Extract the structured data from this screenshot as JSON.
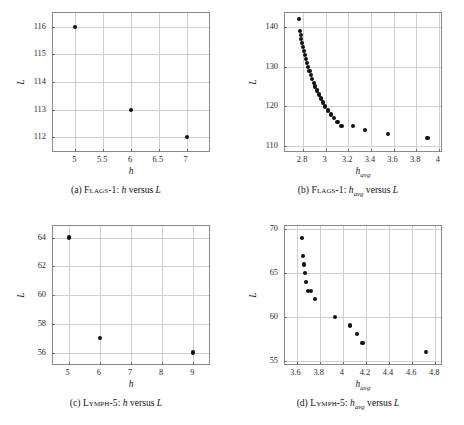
{
  "figure": {
    "panels": [
      {
        "id": "a",
        "caption_index": "(a)",
        "caption_dataset": "Flags-1",
        "caption_rest": ": h versus L",
        "caption_full": "(a) Flags-1: h versus L"
      },
      {
        "id": "b",
        "caption_index": "(b)",
        "caption_dataset": "Flags-1",
        "caption_rest": ": havg versus L",
        "caption_full": "(b) Flags-1: h_avg versus L"
      },
      {
        "id": "c",
        "caption_index": "(c)",
        "caption_dataset": "Lymph-5",
        "caption_rest": ": h versus L",
        "caption_full": "(c) Lymph-5: h versus L"
      },
      {
        "id": "d",
        "caption_index": "(d)",
        "caption_dataset": "Lymph-5",
        "caption_rest": ": havg versus L",
        "caption_full": "(d) Lymph-5: h_avg versus L"
      }
    ]
  },
  "chart_data": [
    {
      "type": "scatter",
      "panel": "a",
      "title": "(a) Flags-1: h versus L",
      "xlabel": "h",
      "ylabel": "L",
      "xlim": [
        4.6,
        7.4
      ],
      "ylim": [
        111.5,
        116.5
      ],
      "xticks": [
        5,
        5.5,
        6,
        6.5,
        7
      ],
      "xticklabels": [
        "5",
        "5.5",
        "6",
        "6.5",
        "7"
      ],
      "yticks": [
        112,
        113,
        114,
        115,
        116
      ],
      "yticklabels": [
        "112",
        "113",
        "114",
        "115",
        "116"
      ],
      "grid": true,
      "legend": null,
      "marker": "filled-circle",
      "marker_color": "#111111",
      "x": [
        5,
        6,
        7
      ],
      "y": [
        116,
        113,
        112
      ],
      "points": [
        {
          "x": 5,
          "y": 116
        },
        {
          "x": 6,
          "y": 113
        },
        {
          "x": 7,
          "y": 112
        }
      ]
    },
    {
      "type": "scatter",
      "panel": "b",
      "title": "(b) Flags-1: h_avg versus L",
      "xlabel": "h_avg",
      "ylabel": "L",
      "xlim": [
        2.64,
        4.02
      ],
      "ylim": [
        108.8,
        143.5
      ],
      "xticks": [
        2.8,
        3.0,
        3.2,
        3.4,
        3.6,
        3.8,
        4.0
      ],
      "xticklabels": [
        "2.8",
        "3",
        "3.2",
        "3.4",
        "3.6",
        "3.8",
        "4"
      ],
      "yticks": [
        110,
        120,
        130,
        140
      ],
      "yticklabels": [
        "110",
        "120",
        "130",
        "140"
      ],
      "grid": true,
      "legend": null,
      "marker": "filled-circle",
      "marker_color": "#111111",
      "x": [
        2.765,
        2.771,
        2.778,
        2.785,
        2.792,
        2.8,
        2.808,
        2.817,
        2.826,
        2.836,
        2.846,
        2.857,
        2.869,
        2.881,
        2.894,
        2.908,
        2.923,
        2.939,
        2.957,
        2.976,
        2.997,
        3.02,
        3.045,
        3.073,
        3.105,
        3.14,
        3.18,
        3.243,
        3.345,
        3.55,
        3.9
      ],
      "y": [
        142,
        139,
        138,
        137,
        136,
        135,
        134,
        133,
        132,
        131,
        130,
        129,
        128,
        127,
        126,
        125,
        124,
        123,
        122,
        121,
        120,
        119,
        118,
        117,
        116,
        115,
        115,
        115,
        114,
        113,
        112
      ],
      "points": [
        {
          "x": 2.765,
          "y": 142
        },
        {
          "x": 2.771,
          "y": 139
        },
        {
          "x": 2.778,
          "y": 138
        },
        {
          "x": 2.785,
          "y": 137
        },
        {
          "x": 2.792,
          "y": 136
        },
        {
          "x": 2.8,
          "y": 135
        },
        {
          "x": 2.808,
          "y": 134
        },
        {
          "x": 2.817,
          "y": 133
        },
        {
          "x": 2.826,
          "y": 132
        },
        {
          "x": 2.836,
          "y": 131
        },
        {
          "x": 2.846,
          "y": 130
        },
        {
          "x": 2.857,
          "y": 129
        },
        {
          "x": 2.869,
          "y": 128
        },
        {
          "x": 2.881,
          "y": 127
        },
        {
          "x": 2.894,
          "y": 126
        },
        {
          "x": 2.908,
          "y": 125
        },
        {
          "x": 2.923,
          "y": 124
        },
        {
          "x": 2.939,
          "y": 123
        },
        {
          "x": 2.957,
          "y": 122
        },
        {
          "x": 2.976,
          "y": 121
        },
        {
          "x": 2.997,
          "y": 120
        },
        {
          "x": 3.02,
          "y": 119
        },
        {
          "x": 3.045,
          "y": 118
        },
        {
          "x": 3.073,
          "y": 117
        },
        {
          "x": 3.105,
          "y": 116
        },
        {
          "x": 3.14,
          "y": 115
        },
        {
          "x": 3.243,
          "y": 115
        },
        {
          "x": 3.345,
          "y": 114
        },
        {
          "x": 3.55,
          "y": 113
        },
        {
          "x": 3.9,
          "y": 112
        }
      ]
    },
    {
      "type": "scatter",
      "panel": "c",
      "title": "(c) Lymph-5: h versus L",
      "xlabel": "h",
      "ylabel": "L",
      "xlim": [
        4.5,
        9.5
      ],
      "ylim": [
        55.2,
        64.8
      ],
      "xticks": [
        5,
        6,
        7,
        8,
        9
      ],
      "xticklabels": [
        "5",
        "6",
        "7",
        "8",
        "9"
      ],
      "yticks": [
        56,
        58,
        60,
        62,
        64
      ],
      "yticklabels": [
        "56",
        "58",
        "60",
        "62",
        "64"
      ],
      "grid": true,
      "legend": null,
      "marker": "filled-circle",
      "marker_color": "#111111",
      "x": [
        5,
        6,
        9
      ],
      "y": [
        64,
        57,
        56
      ],
      "points": [
        {
          "x": 5,
          "y": 64
        },
        {
          "x": 6,
          "y": 57
        },
        {
          "x": 9,
          "y": 56
        }
      ]
    },
    {
      "type": "scatter",
      "panel": "d",
      "title": "(d) Lymph-5: h_avg versus L",
      "xlabel": "h_avg",
      "ylabel": "L",
      "xlim": [
        3.5,
        4.85
      ],
      "ylim": [
        54.6,
        70.4
      ],
      "xticks": [
        3.6,
        3.8,
        4.0,
        4.2,
        4.4,
        4.6,
        4.8
      ],
      "xticklabels": [
        "3.6",
        "3.8",
        "4",
        "4.2",
        "4.4",
        "4.6",
        "4.8"
      ],
      "yticks": [
        55,
        60,
        65,
        70
      ],
      "yticklabels": [
        "55",
        "60",
        "65",
        "70"
      ],
      "grid": true,
      "legend": null,
      "marker": "filled-circle",
      "marker_color": "#111111",
      "x": [
        3.645,
        3.655,
        3.662,
        3.672,
        3.684,
        3.702,
        3.725,
        3.762,
        3.932,
        4.06,
        4.12,
        4.17,
        4.72
      ],
      "y": [
        69,
        67,
        66,
        65,
        64,
        63,
        63,
        62,
        60,
        59,
        58,
        57,
        56
      ],
      "points": [
        {
          "x": 3.645,
          "y": 69
        },
        {
          "x": 3.655,
          "y": 67
        },
        {
          "x": 3.662,
          "y": 66
        },
        {
          "x": 3.672,
          "y": 65
        },
        {
          "x": 3.684,
          "y": 64
        },
        {
          "x": 3.702,
          "y": 63
        },
        {
          "x": 3.725,
          "y": 63
        },
        {
          "x": 3.762,
          "y": 62
        },
        {
          "x": 3.932,
          "y": 60
        },
        {
          "x": 4.06,
          "y": 59
        },
        {
          "x": 4.12,
          "y": 58
        },
        {
          "x": 4.17,
          "y": 57
        },
        {
          "x": 4.72,
          "y": 56
        }
      ]
    }
  ]
}
